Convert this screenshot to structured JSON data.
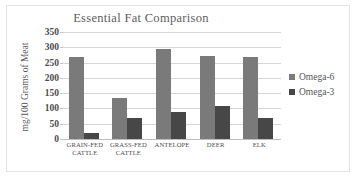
{
  "chart_data": {
    "type": "bar",
    "title": "Essential Fat Comparison",
    "xlabel": "",
    "ylabel": "mg/100 Grams of Meat",
    "ylim": [
      0,
      350
    ],
    "yticks": [
      0,
      50,
      100,
      150,
      200,
      250,
      300,
      350
    ],
    "ytick_labels": [
      "0",
      "50",
      "100",
      "150",
      "200",
      "250",
      "300",
      "350"
    ],
    "grid": true,
    "legend_position": "right",
    "categories": [
      "GRAIN-FED CATTLE",
      "GRASS-FED CATTLE",
      "ANTELOPE",
      "DEER",
      "ELK"
    ],
    "category_lines": [
      [
        "GRAIN-FED",
        "CATTLE"
      ],
      [
        "GRASS-FED",
        "CATTLE"
      ],
      [
        "ANTELOPE"
      ],
      [
        "DEER"
      ],
      [
        "ELK"
      ]
    ],
    "series": [
      {
        "name": "Omega-6",
        "color": "#7a7a7a",
        "values": [
          267,
          135,
          295,
          270,
          267
        ]
      },
      {
        "name": "Omega-3",
        "color": "#474747",
        "values": [
          20,
          70,
          90,
          107,
          70
        ]
      }
    ]
  },
  "colors": {
    "omega6": "#7a7a7a",
    "omega3": "#474747",
    "gridline": "#d6d6d6",
    "baseline": "#bdbdbd",
    "text": "#4b4b4b",
    "title": "#5d5d5d",
    "frame_border": "#e3e3e3",
    "background": "#ffffff"
  }
}
